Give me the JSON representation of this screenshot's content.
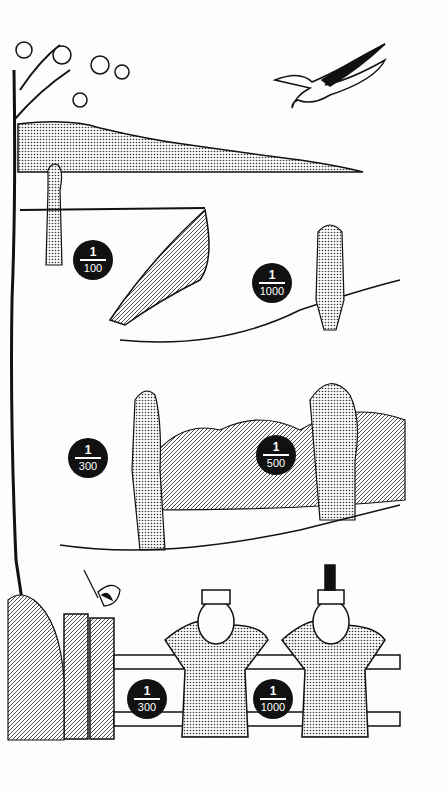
{
  "illustration": {
    "subject": "camera shutter speeds for moving subjects",
    "badges": [
      {
        "id": "b1",
        "numerator": "1",
        "denominator": "100",
        "x": 73,
        "y": 240
      },
      {
        "id": "b2",
        "numerator": "1",
        "denominator": "1000",
        "x": 252,
        "y": 263
      },
      {
        "id": "b3",
        "numerator": "1",
        "denominator": "300",
        "x": 68,
        "y": 438
      },
      {
        "id": "b4",
        "numerator": "1",
        "denominator": "500",
        "x": 256,
        "y": 435
      },
      {
        "id": "b5",
        "numerator": "1",
        "denominator": "300",
        "x": 127,
        "y": 679
      },
      {
        "id": "b6",
        "numerator": "1",
        "denominator": "1000",
        "x": 253,
        "y": 679
      }
    ],
    "colors": {
      "ink": "#111111",
      "paper": "#fdfdfb",
      "stipple": "#9a9a9a"
    }
  }
}
